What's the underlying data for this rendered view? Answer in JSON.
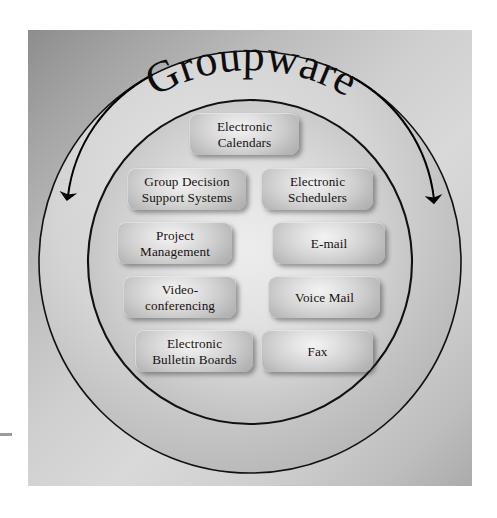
{
  "diagram": {
    "title": "Groupware",
    "type": "circular-grouping-diagram",
    "background_color": "#cfcfcf",
    "frame_color": "#b0b0b0",
    "ring_stroke_color": "#111111",
    "arrow_color": "#000000",
    "box_text_color": "#17110f",
    "rings": [
      {
        "name": "outer-ring",
        "cx": 250,
        "cy": 262,
        "r": 211
      },
      {
        "name": "inner-ring",
        "cx": 250,
        "cy": 262,
        "r": 162
      }
    ],
    "arrows": [
      {
        "name": "left-arc-arrow",
        "direction": "downward",
        "side": "left"
      },
      {
        "name": "right-arc-arrow",
        "direction": "downward",
        "side": "right"
      }
    ],
    "items": [
      {
        "id": "electronic-calendars",
        "label": "Electronic\nCalendars",
        "column": "center",
        "row": 0,
        "x": 189,
        "y": 113,
        "w": 110,
        "h": 42
      },
      {
        "id": "group-decision-support",
        "label": "Group Decision\nSupport Systems",
        "column": "left",
        "row": 1,
        "x": 127,
        "y": 168,
        "w": 119,
        "h": 42
      },
      {
        "id": "electronic-schedulers",
        "label": "Electronic\nSchedulers",
        "column": "right",
        "row": 1,
        "x": 261,
        "y": 168,
        "w": 112,
        "h": 42
      },
      {
        "id": "project-management",
        "label": "Project\nManagement",
        "column": "left",
        "row": 2,
        "x": 117,
        "y": 222,
        "w": 115,
        "h": 42
      },
      {
        "id": "e-mail",
        "label": "E-mail",
        "column": "right",
        "row": 2,
        "x": 272,
        "y": 222,
        "w": 113,
        "h": 42
      },
      {
        "id": "video-conferencing",
        "label": "Video-\nconferencing",
        "column": "left",
        "row": 3,
        "x": 123,
        "y": 276,
        "w": 113,
        "h": 42
      },
      {
        "id": "voice-mail",
        "label": "Voice Mail",
        "column": "right",
        "row": 3,
        "x": 268,
        "y": 276,
        "w": 112,
        "h": 42
      },
      {
        "id": "electronic-bulletin-boards",
        "label": "Electronic\nBulletin Boards",
        "column": "left",
        "row": 4,
        "x": 135,
        "y": 330,
        "w": 118,
        "h": 42
      },
      {
        "id": "fax",
        "label": "Fax",
        "column": "right",
        "row": 4,
        "x": 261,
        "y": 330,
        "w": 112,
        "h": 42
      }
    ]
  }
}
